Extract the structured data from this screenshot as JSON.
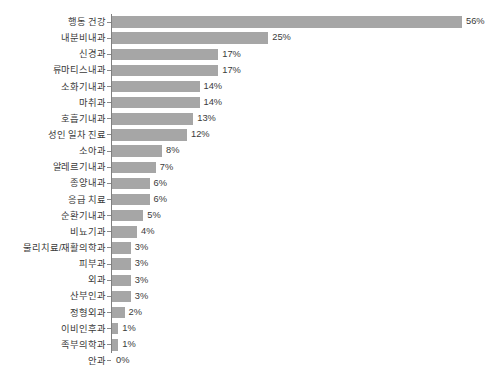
{
  "chart": {
    "title": "",
    "axis_color": "#7f7f7f",
    "bar_color": "#a6a6a6",
    "text_color": "#3a3a3a",
    "background": "#ffffff"
  },
  "chart_data": {
    "type": "bar",
    "orientation": "horizontal",
    "title": "",
    "subtitle": "",
    "xlabel": "",
    "ylabel": "",
    "xlim": [
      0,
      56
    ],
    "grid": false,
    "legend": null,
    "value_suffix": "%",
    "categories": [
      "행동 건강",
      "내분비내과",
      "신경과",
      "류마티스내과",
      "소화기내과",
      "마취과",
      "호흡기내과",
      "성인 일차 진료",
      "소아과",
      "알레르기내과",
      "종양내과",
      "응급 치료",
      "순환기내과",
      "비뇨기과",
      "물리치료/재활의학과",
      "피부과",
      "외과",
      "산부인과",
      "정형외과",
      "이비인후과",
      "족부의학과",
      "안과"
    ],
    "values": [
      56,
      25,
      17,
      17,
      14,
      14,
      13,
      12,
      8,
      7,
      6,
      6,
      5,
      4,
      3,
      3,
      3,
      3,
      2,
      1,
      1,
      0
    ],
    "data_labels": [
      "56%",
      "25%",
      "17%",
      "17%",
      "14%",
      "14%",
      "13%",
      "12%",
      "8%",
      "7%",
      "6%",
      "6%",
      "5%",
      "4%",
      "3%",
      "3%",
      "3%",
      "3%",
      "2%",
      "1%",
      "1%",
      "0%"
    ]
  }
}
